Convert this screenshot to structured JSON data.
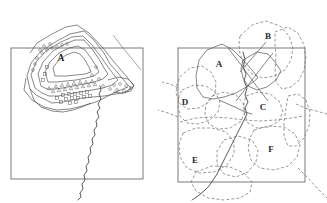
{
  "figure": {
    "background_color": "#ffffff",
    "stroke_color": "#555555",
    "frame_color": "#7a7a7a",
    "width": 327,
    "height": 203
  },
  "left_panel": {
    "name": "left-map-panel",
    "frame": {
      "x": 11,
      "y": 48,
      "width": 132,
      "height": 131
    },
    "labels": [
      {
        "id": "A",
        "text": "A",
        "x": 61,
        "y": 61
      }
    ],
    "marker_legend": [
      {
        "shape": "circle",
        "name": "circle-marker"
      },
      {
        "shape": "triangle",
        "name": "triangle-marker"
      },
      {
        "shape": "square",
        "name": "square-marker"
      }
    ],
    "contours": [
      {
        "name": "contour-outer",
        "points": "30,89 27,76 31,63 41,51 57,41 70,34 84,31 93,39 104,53 110,64 118,73 127,84 131,88 124,93 115,94 104,96 93,97 82,98 72,100 63,102 52,103 44,99 36,95"
      },
      {
        "name": "contour-second",
        "points": "35,88 31,75 36,62 47,50 61,42 72,37 83,36 92,45 101,57 108,67 114,75 118,80 112,85 103,88 92,90 80,92 69,94 58,96 49,96 42,93"
      },
      {
        "name": "contour-third",
        "points": "41,86 38,74 43,62 53,51 65,44 75,40 84,40 92,49 99,59 104,68 108,74 103,79 94,82 84,84 73,86 63,88 54,89 47,89"
      },
      {
        "name": "contour-inner",
        "points": "48,82 45,72 50,62 59,53 69,48 78,46 85,50 91,58 96,66 99,72 94,76 86,78 76,80 66,81 57,82"
      },
      {
        "name": "contour-core",
        "points": "55,76 53,68 58,61 66,55 74,52 80,54 85,60 89,67 91,72 85,74 76,75 66,76 60,76"
      },
      {
        "name": "outer-envelope-upper",
        "points": "30,53 37,43 52,34 66,27 77,25 89,33 103,48 114,62 127,77 134,86 125,93"
      },
      {
        "name": "outer-envelope-lower",
        "points": "26,78 24,90 32,100 44,107 57,110 70,109 82,106 96,102 108,96 118,91 128,87"
      },
      {
        "name": "lobe-lower-left",
        "points": "30,89 34,100 41,107 52,111 63,112 73,110 82,107 91,103"
      },
      {
        "name": "lobe-right-tab",
        "points": "108,80 118,77 128,79 134,85 131,91 122,93 113,92"
      }
    ],
    "river": {
      "name": "river-line",
      "points": "100,86 101,90 99,94 101,99 98,104 100,108 97,112 99,117 96,121 97,126 94,130 95,135 92,139 93,144 90,148 91,153 88,157 89,162 86,166 87,171 84,175 85,180 82,184 83,189 80,193 81,197 78,200"
    },
    "diagonal_line": {
      "name": "diagonal-transect-line",
      "points": "113,35 123,48 133,60 141,70"
    },
    "markers": {
      "circles": [
        {
          "x": 42,
          "y": 53
        },
        {
          "x": 47,
          "y": 50
        },
        {
          "x": 52,
          "y": 48
        },
        {
          "x": 57,
          "y": 47
        },
        {
          "x": 62,
          "y": 45
        },
        {
          "x": 67,
          "y": 44
        },
        {
          "x": 37,
          "y": 58
        },
        {
          "x": 35,
          "y": 64
        },
        {
          "x": 33,
          "y": 70
        },
        {
          "x": 44,
          "y": 46
        },
        {
          "x": 50,
          "y": 44
        },
        {
          "x": 40,
          "y": 50
        },
        {
          "x": 114,
          "y": 85
        },
        {
          "x": 120,
          "y": 84
        },
        {
          "x": 126,
          "y": 86
        },
        {
          "x": 131,
          "y": 88
        },
        {
          "x": 110,
          "y": 89
        },
        {
          "x": 117,
          "y": 90
        },
        {
          "x": 124,
          "y": 91
        },
        {
          "x": 96,
          "y": 67
        },
        {
          "x": 92,
          "y": 75
        },
        {
          "x": 99,
          "y": 79
        },
        {
          "x": 103,
          "y": 86
        }
      ],
      "triangles": [
        {
          "x": 56,
          "y": 86
        },
        {
          "x": 62,
          "y": 85
        },
        {
          "x": 68,
          "y": 84
        },
        {
          "x": 74,
          "y": 83
        },
        {
          "x": 80,
          "y": 82
        },
        {
          "x": 86,
          "y": 82
        },
        {
          "x": 92,
          "y": 81
        },
        {
          "x": 59,
          "y": 90
        },
        {
          "x": 65,
          "y": 89
        },
        {
          "x": 71,
          "y": 88
        },
        {
          "x": 77,
          "y": 87
        },
        {
          "x": 83,
          "y": 86
        },
        {
          "x": 89,
          "y": 85
        },
        {
          "x": 49,
          "y": 88
        },
        {
          "x": 53,
          "y": 91
        },
        {
          "x": 95,
          "y": 84
        }
      ],
      "squares": [
        {
          "x": 63,
          "y": 95
        },
        {
          "x": 69,
          "y": 94
        },
        {
          "x": 75,
          "y": 94
        },
        {
          "x": 81,
          "y": 93
        },
        {
          "x": 87,
          "y": 92
        },
        {
          "x": 66,
          "y": 99
        },
        {
          "x": 72,
          "y": 98
        },
        {
          "x": 78,
          "y": 98
        },
        {
          "x": 84,
          "y": 97
        },
        {
          "x": 90,
          "y": 96
        },
        {
          "x": 57,
          "y": 98
        },
        {
          "x": 61,
          "y": 102
        },
        {
          "x": 45,
          "y": 74
        },
        {
          "x": 43,
          "y": 80
        },
        {
          "x": 47,
          "y": 67
        },
        {
          "x": 70,
          "y": 103
        },
        {
          "x": 76,
          "y": 102
        }
      ]
    }
  },
  "right_panel": {
    "name": "right-map-panel",
    "frame": {
      "x": 178,
      "y": 48,
      "width": 127,
      "height": 134
    },
    "labels": [
      {
        "id": "A",
        "text": "A",
        "x": 219,
        "y": 67
      },
      {
        "id": "B",
        "text": "B",
        "x": 268,
        "y": 39
      },
      {
        "id": "C",
        "text": "C",
        "x": 263,
        "y": 110
      },
      {
        "id": "D",
        "text": "D",
        "x": 185,
        "y": 105
      },
      {
        "id": "E",
        "text": "E",
        "x": 195,
        "y": 163
      },
      {
        "id": "F",
        "text": "F",
        "x": 271,
        "y": 152
      }
    ],
    "leader_lines": [
      {
        "name": "leader-line-b",
        "points": "266,42 247,64 240,72"
      }
    ],
    "solid_polygons": [
      {
        "name": "solid-polygon-a",
        "points": "199,60 207,50 222,44 233,50 243,60 252,70 258,78 248,86 236,93 224,97 213,99 203,97 197,88 196,76"
      },
      {
        "name": "solid-polygon-b",
        "points": "243,60 257,52 268,54 275,62 281,71 276,80 267,87 257,90 248,86 243,78 241,69"
      },
      {
        "name": "solid-crossing-1",
        "points": "228,48 242,66 252,80 261,92 268,101"
      },
      {
        "name": "solid-crossing-2",
        "points": "273,53 262,67 252,80 243,92 236,101"
      }
    ],
    "dashed_polygons": [
      {
        "name": "dashed-polygon-north",
        "points": "240,36 252,25 266,21 280,26 289,36 293,48 291,60 285,70 275,76 263,78 252,74 244,65 240,54 239,44"
      },
      {
        "name": "dashed-polygon-northeast",
        "points": "275,32 288,27 298,33 304,45 306,58 304,70 299,80 291,87 282,89 276,82 275,70 276,56 275,44"
      },
      {
        "name": "dashed-polygon-west",
        "points": "180,77 190,68 202,66 211,72 216,82 215,93 209,102 199,108 188,109 180,104 176,93 177,84"
      },
      {
        "name": "dashed-polygon-d",
        "points": "182,90 194,85 206,86 215,92 220,102 218,112 210,120 198,124 187,123 180,116 178,105 179,96"
      },
      {
        "name": "dashed-polygon-central",
        "points": "212,96 224,92 236,95 243,103 245,113 240,122 230,128 218,129 209,124 205,114 206,104"
      },
      {
        "name": "dashed-polygon-c",
        "points": "246,96 258,92 270,94 279,101 283,111 279,121 269,127 257,128 248,123 244,113 244,103"
      },
      {
        "name": "dashed-band-mid",
        "points": "180,122 196,118 212,117 228,118 244,120 260,121 276,120 292,118 303,116"
      },
      {
        "name": "dashed-polygon-e",
        "points": "183,133 196,128 212,128 226,132 234,142 234,154 227,165 214,172 199,173 187,168 180,157 179,144"
      },
      {
        "name": "dashed-polygon-f",
        "points": "254,130 268,126 284,127 295,134 300,145 297,157 288,166 274,170 260,168 251,160 248,148 250,138"
      },
      {
        "name": "dashed-polygon-south",
        "points": "196,172 212,166 230,167 244,173 252,182 250,192 240,198 224,200 208,198 196,191 191,182"
      },
      {
        "name": "dashed-polygon-southcentral",
        "points": "224,140 238,136 252,140 258,150 256,162 248,172 236,177 224,174 217,164 217,151"
      },
      {
        "name": "dashed-polygon-east-lower",
        "points": "288,96 298,94 306,100 310,112 309,126 304,138 296,146 288,146 284,136 284,122 286,108"
      },
      {
        "name": "dashed-line-transect-right",
        "points": "296,104 305,108 316,111 327,114"
      },
      {
        "name": "dashed-line-transect-left",
        "points": "178,117 168,113 158,110"
      },
      {
        "name": "dashed-line-lower-right",
        "points": "298,168 308,178 318,189 327,198"
      },
      {
        "name": "dashed-line-upper-left",
        "points": "178,88 170,84 162,82"
      }
    ],
    "river": {
      "name": "river-line-right",
      "points": "243,52 245,60 243,67 246,74 244,81 247,88 245,95 248,102 245,108 247,114 244,120 241,126 238,132 235,138 232,144 229,150 226,156 223,162 220,168 217,174 213,180 209,186 204,191 198,196 192,200"
    },
    "river_branch": {
      "name": "river-branch-right",
      "points": "219,100 228,104 237,108 245,112 252,114"
    }
  }
}
